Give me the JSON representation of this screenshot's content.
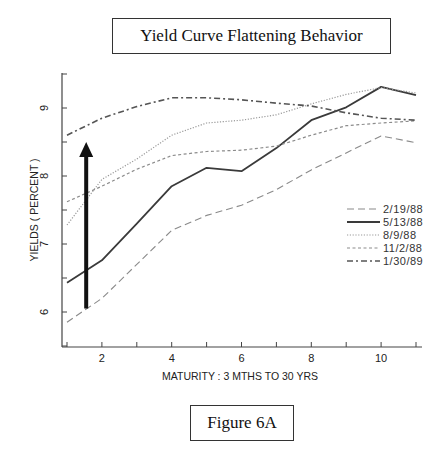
{
  "title": "Yield Curve Flattening Behavior",
  "figure_label": "Figure 6A",
  "chart_data": {
    "type": "line",
    "title": "Yield Curve Flattening Behavior",
    "xlabel": "MATURITY : 3 MTHS TO 30 YRS",
    "ylabel": "YIELDS ( PERCENT )",
    "x": [
      1,
      2,
      3,
      4,
      5,
      6,
      7,
      8,
      9,
      10,
      11
    ],
    "x_ticks": [
      2,
      4,
      6,
      8,
      10
    ],
    "y_ticks": [
      6,
      7,
      8,
      9
    ],
    "xlim": [
      1,
      11
    ],
    "ylim": [
      5.5,
      9.5
    ],
    "grid": false,
    "legend_position": "right, lower-middle",
    "series": [
      {
        "name": "2/19/88",
        "style": "dash",
        "values": [
          5.85,
          6.2,
          6.7,
          7.2,
          7.42,
          7.57,
          7.8,
          8.09,
          8.34,
          8.59,
          8.49
        ]
      },
      {
        "name": "5/13/88",
        "style": "solid",
        "values": [
          6.43,
          6.76,
          7.3,
          7.85,
          8.12,
          8.07,
          8.41,
          8.82,
          9.01,
          9.31,
          9.19
        ]
      },
      {
        "name": "8/9/88",
        "style": "dotted",
        "values": [
          7.28,
          7.95,
          8.25,
          8.6,
          8.78,
          8.82,
          8.9,
          9.06,
          9.2,
          9.3,
          9.22
        ]
      },
      {
        "name": "11/2/88",
        "style": "short-dash",
        "values": [
          7.62,
          7.85,
          8.1,
          8.3,
          8.36,
          8.38,
          8.44,
          8.6,
          8.74,
          8.78,
          8.81
        ]
      },
      {
        "name": "1/30/89",
        "style": "dash-dot",
        "values": [
          8.6,
          8.85,
          9.02,
          9.15,
          9.15,
          9.12,
          9.07,
          9.03,
          8.93,
          8.85,
          8.82
        ]
      }
    ],
    "annotations": [
      {
        "type": "arrow",
        "direction": "up",
        "x": 1.55,
        "y_from": 6.05,
        "y_to": 8.5
      }
    ]
  },
  "axis": {
    "x_ticks_labels": [
      "2",
      "4",
      "6",
      "8",
      "10"
    ],
    "y_ticks_labels": [
      "6",
      "7",
      "8",
      "9"
    ]
  }
}
